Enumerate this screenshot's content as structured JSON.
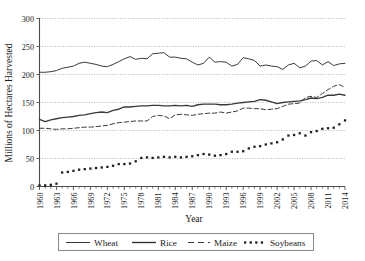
{
  "chart_data": {
    "type": "line",
    "title": "",
    "xlabel": "Year",
    "ylabel": "Millions of Hectares Harvested",
    "xlim": [
      1960,
      2014
    ],
    "ylim": [
      0,
      300
    ],
    "ytick_values": [
      0,
      50,
      100,
      150,
      200,
      250,
      300
    ],
    "ytick_labels": [
      "0",
      "50",
      "100",
      "150",
      "200",
      "250",
      "300"
    ],
    "xtick_values": [
      1960,
      1963,
      1966,
      1969,
      1972,
      1975,
      1978,
      1981,
      1984,
      1987,
      1990,
      1993,
      1996,
      1999,
      2002,
      2005,
      2008,
      2011,
      2014
    ],
    "xtick_labels": [
      "1960",
      "1963",
      "1966",
      "1969",
      "1972",
      "1975",
      "1978",
      "1981",
      "1984",
      "1987",
      "1990",
      "1993",
      "1996",
      "1999",
      "2002",
      "2005",
      "2008",
      "2011",
      "2014"
    ],
    "x": [
      1960,
      1961,
      1962,
      1963,
      1964,
      1965,
      1966,
      1967,
      1968,
      1969,
      1970,
      1971,
      1972,
      1973,
      1974,
      1975,
      1976,
      1977,
      1978,
      1979,
      1980,
      1981,
      1982,
      1983,
      1984,
      1985,
      1986,
      1987,
      1988,
      1989,
      1990,
      1991,
      1992,
      1993,
      1994,
      1995,
      1996,
      1997,
      1998,
      1999,
      2000,
      2001,
      2002,
      2003,
      2004,
      2005,
      2006,
      2007,
      2008,
      2009,
      2010,
      2011,
      2012,
      2013,
      2014
    ],
    "grid": "horizontal-dotted",
    "legend_position": "bottom-center",
    "series": [
      {
        "name": "Wheat",
        "style": "solid",
        "color": "#3a3a3a",
        "values": [
          204,
          204,
          205,
          207,
          211,
          213,
          215,
          220,
          222,
          220,
          218,
          215,
          214,
          218,
          223,
          228,
          232,
          227,
          229,
          228,
          237,
          238,
          239,
          231,
          231,
          229,
          228,
          222,
          217,
          220,
          231,
          222,
          223,
          222,
          215,
          218,
          230,
          228,
          225,
          215,
          217,
          215,
          214,
          209,
          217,
          220,
          212,
          215,
          224,
          225,
          217,
          223,
          216,
          219,
          220
        ]
      },
      {
        "name": "Rice",
        "style": "solid-thick",
        "color": "#303030",
        "values": [
          120,
          116,
          119,
          121,
          123,
          124,
          125,
          127,
          128,
          130,
          132,
          133,
          132,
          136,
          138,
          142,
          142,
          143,
          144,
          144,
          145,
          145,
          144,
          144,
          145,
          144,
          145,
          143,
          146,
          147,
          147,
          147,
          146,
          146,
          147,
          149,
          150,
          151,
          152,
          155,
          154,
          151,
          148,
          150,
          151,
          152,
          153,
          155,
          158,
          157,
          159,
          163,
          163,
          165,
          163
        ]
      },
      {
        "name": "Maize",
        "style": "dashed",
        "color": "#3a3a3a",
        "values": [
          104,
          104,
          103,
          102,
          103,
          103,
          104,
          105,
          106,
          106,
          107,
          108,
          109,
          112,
          114,
          115,
          116,
          117,
          117,
          117,
          125,
          127,
          126,
          121,
          128,
          129,
          128,
          127,
          129,
          130,
          131,
          131,
          133,
          131,
          133,
          135,
          140,
          140,
          139,
          139,
          137,
          138,
          139,
          143,
          147,
          148,
          149,
          159,
          161,
          159,
          166,
          173,
          179,
          182,
          177
        ]
      },
      {
        "name": "Soybeans",
        "style": "dotted",
        "color": "#1f1f1f",
        "values": [
          2,
          2,
          3,
          5,
          25,
          26,
          28,
          30,
          31,
          32,
          33,
          34,
          35,
          37,
          40,
          40,
          41,
          45,
          51,
          52,
          51,
          52,
          53,
          52,
          53,
          52,
          53,
          54,
          56,
          58,
          57,
          55,
          56,
          58,
          62,
          62,
          63,
          68,
          71,
          72,
          75,
          77,
          79,
          84,
          91,
          92,
          95,
          91,
          97,
          99,
          103,
          104,
          105,
          111,
          118
        ]
      }
    ]
  },
  "legend": {
    "items": [
      {
        "label": "Wheat",
        "style": "solid"
      },
      {
        "label": "Rice",
        "style": "solid-thick"
      },
      {
        "label": "Maize",
        "style": "dashed"
      },
      {
        "label": "Soybeans",
        "style": "dotted"
      }
    ]
  }
}
